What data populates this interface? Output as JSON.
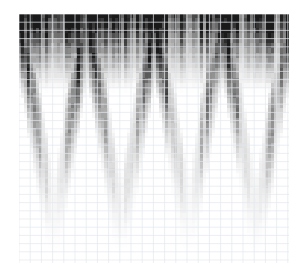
{
  "figure": {
    "name": "grayscale-chevron-heatmap",
    "background_color": "#ffffff",
    "width": 308,
    "height": 277
  },
  "plot": {
    "left": 19,
    "top": 14,
    "width": 270,
    "height": 249,
    "background_color": "#ffffff",
    "grid_color": "#e4e8ec",
    "grid_visible": true,
    "grid_x_spacing": 11.2,
    "grid_y_spacing": 8.2
  },
  "chart_data": {
    "type": "heatmap",
    "title": "",
    "subtitle": "",
    "xlabel": "",
    "ylabel": "",
    "legend": [],
    "annotations": [],
    "grid": true,
    "legend_position": "none",
    "colormap": "grayscale",
    "colormap_min_color": "#ffffff",
    "colormap_max_color": "#1a1a1a",
    "n_columns": 92,
    "n_rows": 50,
    "xlim": [
      0,
      92
    ],
    "ylim": [
      0,
      50
    ],
    "x_tick_labels": [],
    "y_tick_labels": [],
    "pattern": {
      "wave_cycles": 4.0,
      "wave_phase_deg": 0,
      "envelope": "amplitude decays from top (1.0) to bottom (0.0)",
      "column_noise_amplitude": 0.38,
      "column_noise_seed": 20240607,
      "row_noise_amplitude": 0.12,
      "band_top_darkness": 0.92,
      "chevron_sharpness": 2.0
    },
    "series": [
      {
        "name": "intensity",
        "encoding": "grayscale-value",
        "min": 0.0,
        "max": 1.0
      }
    ]
  }
}
